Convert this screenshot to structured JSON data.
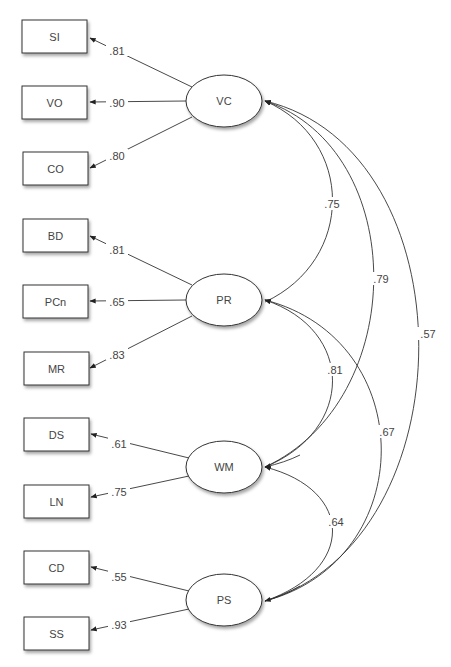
{
  "diagram": {
    "type": "structural-equation-model",
    "factors": [
      {
        "id": "VC",
        "label": "VC",
        "cx": 224,
        "cy": 101
      },
      {
        "id": "PR",
        "label": "PR",
        "cx": 224,
        "cy": 300
      },
      {
        "id": "WM",
        "label": "WM",
        "cx": 224,
        "cy": 467
      },
      {
        "id": "PS",
        "label": "PS",
        "cx": 224,
        "cy": 600
      }
    ],
    "indicators": [
      {
        "label": "SI",
        "factor": "VC",
        "loading": ".81",
        "y": 20
      },
      {
        "label": "VO",
        "factor": "VC",
        "loading": ".90",
        "y": 85
      },
      {
        "label": "CO",
        "factor": "VC",
        "loading": ".80",
        "y": 152
      },
      {
        "label": "BD",
        "factor": "PR",
        "loading": ".81",
        "y": 218
      },
      {
        "label": "PCn",
        "factor": "PR",
        "loading": ".65",
        "y": 285
      },
      {
        "label": "MR",
        "factor": "PR",
        "loading": ".83",
        "y": 352
      },
      {
        "label": "DS",
        "factor": "WM",
        "loading": ".61",
        "y": 418
      },
      {
        "label": "LN",
        "factor": "WM",
        "loading": ".75",
        "y": 485
      },
      {
        "label": "CD",
        "factor": "PS",
        "loading": ".55",
        "y": 551
      },
      {
        "label": "SS",
        "factor": "PS",
        "loading": ".93",
        "y": 617
      }
    ],
    "correlations": [
      {
        "from": "VC",
        "to": "PR",
        "value": ".75"
      },
      {
        "from": "VC",
        "to": "WM",
        "value": ".79"
      },
      {
        "from": "VC",
        "to": "PS",
        "value": ".57"
      },
      {
        "from": "PR",
        "to": "WM",
        "value": ".81"
      },
      {
        "from": "PR",
        "to": "PS",
        "value": ".67"
      },
      {
        "from": "WM",
        "to": "PS",
        "value": ".64"
      }
    ]
  }
}
